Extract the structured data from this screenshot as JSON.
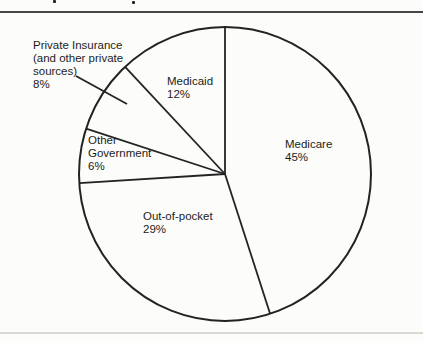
{
  "chart_data": {
    "type": "pie",
    "direction": "clockwise",
    "start_angle_deg": 0,
    "legend": "none",
    "slices": [
      {
        "label": "Medicare",
        "value": 45,
        "pct_label": "45%",
        "label_lines": [
          "Medicare"
        ]
      },
      {
        "label": "Out-of-pocket",
        "value": 29,
        "pct_label": "29%",
        "label_lines": [
          "Out-of-pocket"
        ]
      },
      {
        "label": "Other Government",
        "value": 6,
        "pct_label": "6%",
        "label_lines": [
          "Other",
          "Government"
        ]
      },
      {
        "label": "Private Insurance (and other private sources)",
        "value": 8,
        "pct_label": "8%",
        "label_lines": [
          "Private Insurance",
          "(and other private",
          "sources)"
        ]
      },
      {
        "label": "Medicaid",
        "value": 12,
        "pct_label": "12%",
        "label_lines": [
          "Medicaid"
        ]
      }
    ]
  },
  "colors": {
    "ink": "#232323",
    "text": "#1c1c1c",
    "background": "#fcfcfa",
    "top_rule": "#474747",
    "scan_line": "#d9d9d4"
  }
}
